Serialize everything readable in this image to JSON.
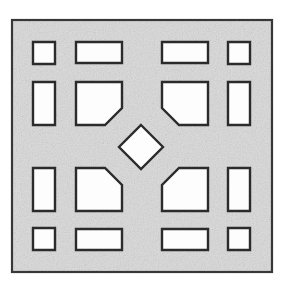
{
  "figure": {
    "type": "technical-line-drawing",
    "canvas": {
      "width": 282,
      "height": 284,
      "background": "#ffffff"
    }
  },
  "style": {
    "plate_fill": "#dedede",
    "plate_stroke": "#3a3a3a",
    "plate_stroke_width": 2.2,
    "cutout_fill": "#fdfdfd",
    "cutout_stroke": "#2b2b2b",
    "cutout_stroke_width": 2.4,
    "texture": "speckled-scan-grain"
  },
  "plate": {
    "name": "outer-plate",
    "shape": "square",
    "x": 12,
    "y": 20,
    "width": 260,
    "height": 252
  },
  "layout": {
    "description": "4 x 4 grid of openings plus one central rotated square",
    "columns_x": [
      33,
      76,
      162,
      228
    ],
    "rows_y": [
      42,
      82,
      186,
      228
    ],
    "small_square_size": 22,
    "wide_rect_width": 46,
    "wide_rect_height": 21,
    "tall_rect_width": 22,
    "tall_rect_height": 43,
    "large_shape_width": 46,
    "large_shape_height": 43,
    "chamfer_size": 17
  },
  "cutouts": [
    {
      "id": "corner-top-left",
      "name": "corner-square-top-left",
      "kind": "square",
      "points": "33,42 55,42 55,64 33,64"
    },
    {
      "id": "edge-top-left",
      "name": "edge-rect-top-left",
      "kind": "wide-rectangle",
      "points": "76,42 122,42 122,63 76,63"
    },
    {
      "id": "edge-top-right",
      "name": "edge-rect-top-right",
      "kind": "wide-rectangle",
      "points": "162,42 208,42 208,63 162,63"
    },
    {
      "id": "corner-top-right",
      "name": "corner-square-top-right",
      "kind": "square",
      "points": "228,42 250,42 250,64 228,64"
    },
    {
      "id": "edge-left-upper",
      "name": "edge-rect-left-upper",
      "kind": "tall-rectangle",
      "points": "33,82 55,82 55,125 33,125"
    },
    {
      "id": "inner-top-left",
      "name": "inner-chamfered-top-left",
      "kind": "chamfered-rectangle",
      "chamfer_corner": "bottom-right",
      "points": "76,82 122,82 122,108 105,125 76,125"
    },
    {
      "id": "inner-top-right",
      "name": "inner-chamfered-top-right",
      "kind": "chamfered-rectangle",
      "chamfer_corner": "bottom-left",
      "points": "162,82 208,82 208,125 179,125 162,108"
    },
    {
      "id": "edge-right-upper",
      "name": "edge-rect-right-upper",
      "kind": "tall-rectangle",
      "points": "228,82 250,82 250,125 228,125"
    },
    {
      "id": "center-diamond",
      "name": "center-diamond",
      "kind": "rotated-square",
      "points": "141,125 163,147 141,169 119,147"
    },
    {
      "id": "edge-left-lower",
      "name": "edge-rect-left-lower",
      "kind": "tall-rectangle",
      "points": "33,168 55,168 55,211 33,211"
    },
    {
      "id": "inner-bottom-left",
      "name": "inner-chamfered-bottom-left",
      "kind": "chamfered-rectangle",
      "chamfer_corner": "top-right",
      "points": "76,168 105,168 122,185 122,211 76,211"
    },
    {
      "id": "inner-bottom-right",
      "name": "inner-chamfered-bottom-right",
      "kind": "chamfered-rectangle",
      "chamfer_corner": "top-left",
      "points": "179,168 208,168 208,211 162,211 162,185"
    },
    {
      "id": "edge-right-lower",
      "name": "edge-rect-right-lower",
      "kind": "tall-rectangle",
      "points": "228,168 250,168 250,211 228,211"
    },
    {
      "id": "corner-bottom-left",
      "name": "corner-square-bottom-left",
      "kind": "square",
      "points": "33,228 55,228 55,250 33,250"
    },
    {
      "id": "edge-bottom-left",
      "name": "edge-rect-bottom-left",
      "kind": "wide-rectangle",
      "points": "76,229 122,229 122,250 76,250"
    },
    {
      "id": "edge-bottom-right",
      "name": "edge-rect-bottom-right",
      "kind": "wide-rectangle",
      "points": "162,229 208,229 208,250 162,250"
    },
    {
      "id": "corner-bottom-right",
      "name": "corner-square-bottom-right",
      "kind": "square",
      "points": "228,228 250,228 250,250 228,250"
    }
  ]
}
